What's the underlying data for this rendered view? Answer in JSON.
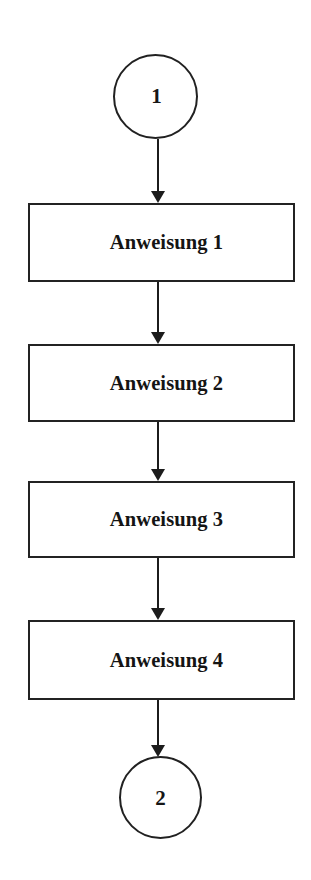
{
  "diagram": {
    "type": "flowchart",
    "orientation": "vertical",
    "language": "de",
    "background_color": "#ffffff",
    "stroke_color": "#1c1c1c",
    "text_color": "#141414",
    "nodes": [
      {
        "id": "start",
        "shape": "circle",
        "label": "1"
      },
      {
        "id": "step1",
        "shape": "rectangle",
        "label": "Anweisung 1"
      },
      {
        "id": "step2",
        "shape": "rectangle",
        "label": "Anweisung 2"
      },
      {
        "id": "step3",
        "shape": "rectangle",
        "label": "Anweisung 3"
      },
      {
        "id": "step4",
        "shape": "rectangle",
        "label": "Anweisung 4"
      },
      {
        "id": "end",
        "shape": "circle",
        "label": "2"
      }
    ],
    "edges": [
      {
        "from": "start",
        "to": "step1",
        "arrow": "down-arrow-icon",
        "label": ""
      },
      {
        "from": "step1",
        "to": "step2",
        "arrow": "down-arrow-icon",
        "label": ""
      },
      {
        "from": "step2",
        "to": "step3",
        "arrow": "down-arrow-icon",
        "label": ""
      },
      {
        "from": "step3",
        "to": "step4",
        "arrow": "down-arrow-icon",
        "label": ""
      },
      {
        "from": "step4",
        "to": "end",
        "arrow": "down-arrow-icon",
        "label": ""
      }
    ]
  }
}
